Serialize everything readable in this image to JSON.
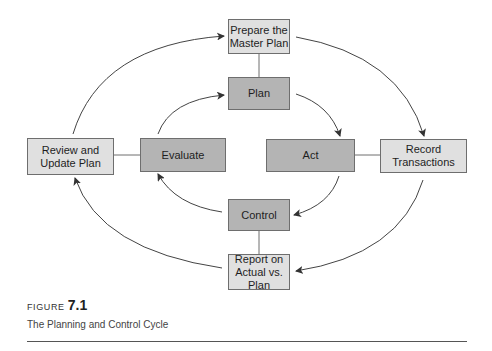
{
  "diagram": {
    "outer_cycle": {
      "prepare": "Prepare the\nMaster Plan",
      "record": "Record\nTransactions",
      "report": "Report on\nActual vs. Plan",
      "review": "Review and\nUpdate Plan"
    },
    "inner_cycle": {
      "plan": "Plan",
      "act": "Act",
      "control": "Control",
      "evaluate": "Evaluate"
    },
    "colors": {
      "outer_fill": "#e0e0e0",
      "inner_fill": "#b4b4b4",
      "border": "#6e6e6e",
      "arrow": "#333333"
    },
    "flow": [
      "Prepare the Master Plan -> Record Transactions",
      "Record Transactions -> Report on Actual vs. Plan",
      "Report on Actual vs. Plan -> Review and Update Plan",
      "Review and Update Plan -> Prepare the Master Plan",
      "Plan -> Act",
      "Act -> Control",
      "Control -> Evaluate",
      "Evaluate -> Plan"
    ]
  },
  "figure": {
    "label": "FIGURE",
    "number": "7.1",
    "caption": "The Planning and Control Cycle"
  }
}
